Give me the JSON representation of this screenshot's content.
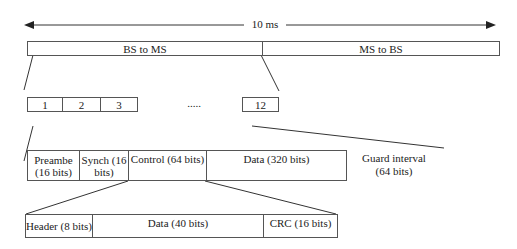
{
  "duration_label": "10 ms",
  "frame": {
    "downlink": "BS to MS",
    "uplink": "MS to BS"
  },
  "slots": {
    "items": [
      "1",
      "2",
      "3"
    ],
    "ellipsis": ".....",
    "last": "12"
  },
  "slot_fields": {
    "preamble": "Preambe (16 bits)",
    "synch": "Synch (16 bits)",
    "control": "Control (64 bits)",
    "data": "Data (320 bits)",
    "guard": "Guard interval (64 bits)"
  },
  "control_fields": {
    "header": "Header (8 bits)",
    "data": "Data (40 bits)",
    "crc": "CRC (16 bits)"
  }
}
